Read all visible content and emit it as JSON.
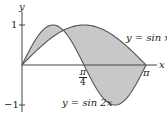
{
  "chart_data": {
    "type": "area",
    "title": "",
    "xlabel": "x",
    "ylabel": "y",
    "xlim": [
      0,
      3.1416
    ],
    "ylim": [
      -1,
      1
    ],
    "x_ticks": [
      {
        "value": 1.5708,
        "label": "π/4"
      },
      {
        "value": 3.1416,
        "label": "π"
      }
    ],
    "y_ticks": [
      {
        "value": 1,
        "label": "1"
      },
      {
        "value": -1,
        "label": "−1"
      }
    ],
    "series": [
      {
        "name": "y = sin x",
        "function": "sin(x)"
      },
      {
        "name": "y = sin 2x",
        "function": "sin(2x)"
      }
    ],
    "shaded_region": "between y = sin x and y = sin 2x on [0, π]",
    "grid": false
  },
  "labels": {
    "y_axis": "y",
    "x_axis": "x",
    "tick_one": "1",
    "tick_neg_one": "−1",
    "pi": "π",
    "frac_num": "π",
    "frac_den": "4",
    "curve_sinx": "y = sin x",
    "curve_sin2x": "y = sin 2x"
  },
  "colors": {
    "fill": "#c8c8c8",
    "curve": "#555555",
    "axis": "#444444"
  }
}
